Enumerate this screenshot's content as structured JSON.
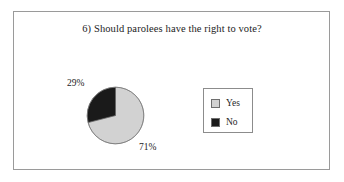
{
  "figure": {
    "title": "6) Should parolees have the right to vote?",
    "frame_color": "#9a9a9a",
    "background": "#ffffff"
  },
  "legend": {
    "position": "right",
    "border_color": "#8c8c8c",
    "entries": [
      {
        "label": "Yes",
        "color": "#d2d2d2"
      },
      {
        "label": "No",
        "color": "#1a1a1a"
      }
    ]
  },
  "labels": {
    "no_pct": "29%",
    "yes_pct": "71%"
  },
  "chart_data": {
    "type": "pie",
    "title": "6) Should parolees have the right to vote?",
    "xlabel": "",
    "ylabel": "",
    "categories": [
      "Yes",
      "No"
    ],
    "values": [
      71,
      29
    ],
    "value_labels": [
      "71%",
      "29%"
    ],
    "colors": [
      "#d2d2d2",
      "#1a1a1a"
    ],
    "units": "percent",
    "start_angle_deg": 0,
    "direction": "clockwise",
    "legend_position": "right",
    "grid": false,
    "slices": [
      {
        "name": "Yes",
        "value": 71,
        "label": "71%",
        "color": "#d2d2d2"
      },
      {
        "name": "No",
        "value": 29,
        "label": "29%",
        "color": "#1a1a1a"
      }
    ]
  }
}
